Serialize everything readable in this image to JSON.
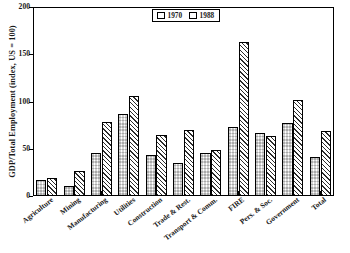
{
  "chart_data": {
    "type": "bar",
    "title": "",
    "xlabel": "",
    "ylabel": "GDP/Total Employment (index, US = 100)",
    "ylim": [
      0,
      200
    ],
    "yticks": [
      0,
      50,
      100,
      150,
      200
    ],
    "grid": false,
    "legend_position": "top-center",
    "categories": [
      "Agriculture",
      "Mining",
      "Manufacturing",
      "Utilities",
      "Construction",
      "Trade & Rest.",
      "Transport & Comm.",
      "FIRE",
      "Pers. & Soc.",
      "Government",
      "Total"
    ],
    "series": [
      {
        "name": "1970",
        "pattern": "checkerboard",
        "values": [
          17,
          11,
          46,
          87,
          43,
          35,
          45,
          73,
          67,
          77,
          41
        ]
      },
      {
        "name": "1988",
        "pattern": "diagonal-hatch",
        "values": [
          19,
          26,
          78,
          106,
          65,
          70,
          49,
          163,
          63,
          102,
          69
        ]
      }
    ]
  },
  "legend": {
    "entries": [
      {
        "label": "1970"
      },
      {
        "label": "1988"
      }
    ]
  },
  "colors": {
    "axis": "#000000",
    "bar_outline": "#000000",
    "pattern_ink": "#2b2b2b",
    "background": "#ffffff"
  }
}
